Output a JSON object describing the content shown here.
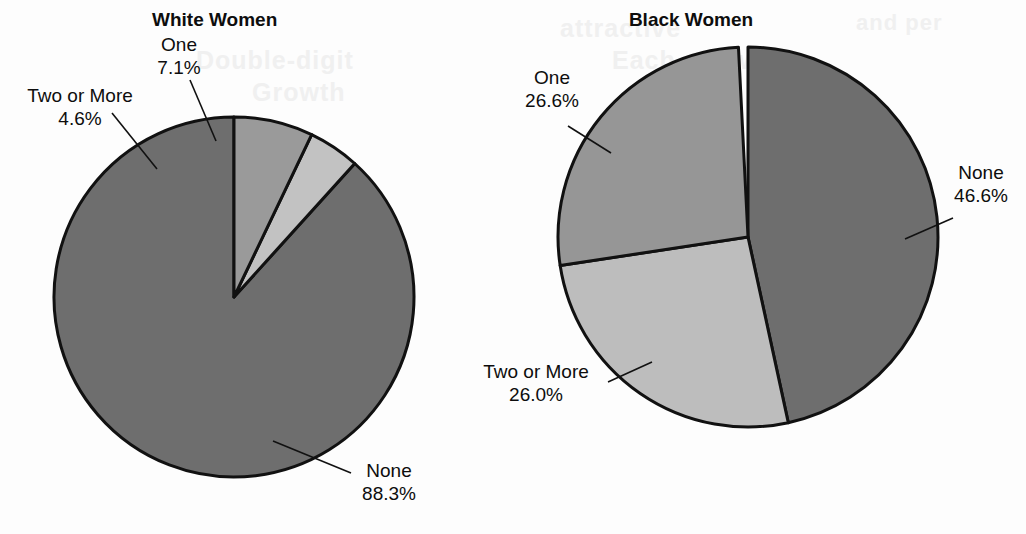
{
  "figure": {
    "background_color": "#fdfdfd",
    "text_color": "#0d0d0d",
    "outline_color": "#111111"
  },
  "ghost_text": {
    "line1": "attractive",
    "line2": "Double-digit",
    "line3": "Each and with",
    "line4": "Growth",
    "line5": "and per"
  },
  "charts": [
    {
      "id": "white-women",
      "title": "White Women",
      "center": {
        "x": 234,
        "y": 297
      },
      "radius": 180,
      "direction": "counterclockwise",
      "start_angle_deg": -90,
      "slices": [
        {
          "label": "None",
          "percent": 88.3,
          "value_text": "88.3%",
          "color": "#6e6e6e"
        },
        {
          "label": "Two or More",
          "percent": 4.6,
          "value_text": "4.6%",
          "color": "#c2c2c2"
        },
        {
          "label": "One",
          "percent": 7.1,
          "value_text": "7.1%",
          "color": "#9a9a9a"
        }
      ],
      "labels": [
        {
          "name": "one",
          "text": "One",
          "value": "7.1%",
          "x": 140,
          "y": 33,
          "width": 78,
          "align": "center"
        },
        {
          "name": "two-or-more",
          "text": "Two or More",
          "value": "4.6%",
          "x": 16,
          "y": 84,
          "width": 128,
          "align": "center"
        },
        {
          "name": "none",
          "text": "None",
          "value": "88.3%",
          "x": 352,
          "y": 459,
          "width": 74,
          "align": "center"
        }
      ],
      "title_pos": {
        "x": 152,
        "y": 8,
        "width": 122
      }
    },
    {
      "id": "black-women",
      "title": "Black Women",
      "center": {
        "x": 748,
        "y": 237
      },
      "radius": 190,
      "direction": "clockwise",
      "start_angle_deg": -90,
      "slices": [
        {
          "label": "None",
          "percent": 46.6,
          "value_text": "46.6%",
          "color": "#6e6e6e"
        },
        {
          "label": "Two or More",
          "percent": 26.0,
          "value_text": "26.0%",
          "color": "#bdbdbd"
        },
        {
          "label": "One",
          "percent": 26.6,
          "value_text": "26.6%",
          "color": "#969696"
        }
      ],
      "labels": [
        {
          "name": "one",
          "text": "One",
          "value": "26.6%",
          "x": 512,
          "y": 66,
          "width": 80,
          "align": "center"
        },
        {
          "name": "none",
          "text": "None",
          "value": "46.6%",
          "x": 944,
          "y": 161,
          "width": 74,
          "align": "center"
        },
        {
          "name": "two-or-more",
          "text": "Two or More",
          "value": "26.0%",
          "x": 472,
          "y": 360,
          "width": 128,
          "align": "center"
        }
      ],
      "title_pos": {
        "x": 628,
        "y": 8,
        "width": 126
      }
    }
  ],
  "leader_lines": [
    {
      "name": "white-one",
      "x1": 190,
      "y1": 80,
      "x2": 216,
      "y2": 141
    },
    {
      "name": "white-two-or-more",
      "x1": 112,
      "y1": 113,
      "x2": 157,
      "y2": 169
    },
    {
      "name": "white-none",
      "x1": 351,
      "y1": 473,
      "x2": 273,
      "y2": 441
    },
    {
      "name": "black-one",
      "x1": 568,
      "y1": 126,
      "x2": 611,
      "y2": 153
    },
    {
      "name": "black-none",
      "x1": 953,
      "y1": 218,
      "x2": 905,
      "y2": 239
    },
    {
      "name": "black-two-or-more",
      "x1": 608,
      "y1": 382,
      "x2": 652,
      "y2": 362
    }
  ],
  "chart_data": [
    {
      "type": "pie",
      "title": "White Women",
      "categories": [
        "None",
        "One",
        "Two or More"
      ],
      "values": [
        88.3,
        7.1,
        4.6
      ],
      "unit": "percent",
      "labels": [
        "None 88.3%",
        "One 7.1%",
        "Two or More 4.6%"
      ],
      "legend_position": "none",
      "grid": false,
      "start_angle_deg": -90,
      "direction": "counterclockwise",
      "slice_colors": [
        "#6e6e6e",
        "#9a9a9a",
        "#c2c2c2"
      ],
      "xlabel": "",
      "ylabel": ""
    },
    {
      "type": "pie",
      "title": "Black Women",
      "categories": [
        "None",
        "Two or More",
        "One"
      ],
      "values": [
        46.6,
        26.0,
        26.6
      ],
      "unit": "percent",
      "labels": [
        "None 46.6%",
        "Two or More 26.0%",
        "One 26.6%"
      ],
      "legend_position": "none",
      "grid": false,
      "start_angle_deg": -90,
      "direction": "clockwise",
      "slice_colors": [
        "#6e6e6e",
        "#bdbdbd",
        "#969696"
      ],
      "xlabel": "",
      "ylabel": ""
    }
  ]
}
